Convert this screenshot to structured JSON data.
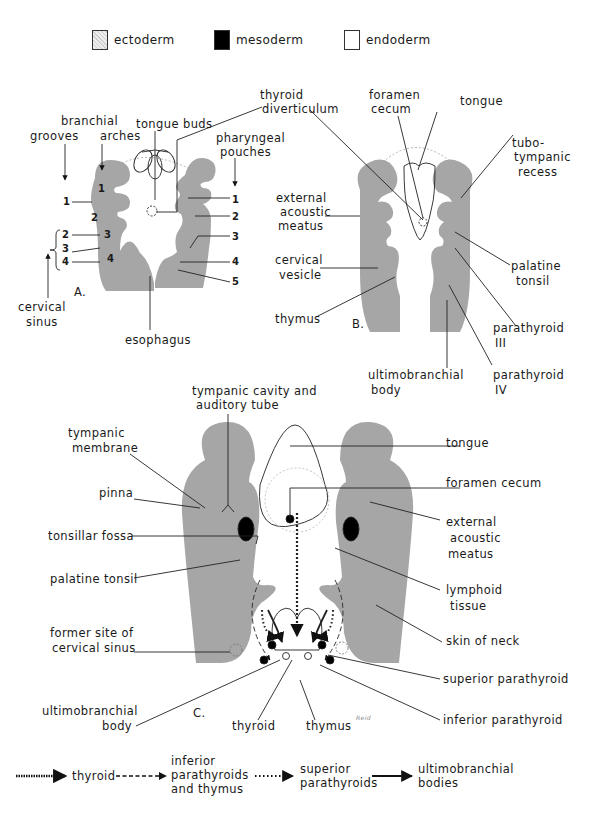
{
  "legend_top": [
    {
      "label": "ectoderm",
      "swatch": "stippled-gray"
    },
    {
      "label": "mesoderm",
      "swatch": "#000000"
    },
    {
      "label": "endoderm",
      "swatch": "#ffffff"
    }
  ],
  "colors": {
    "tissue_gray": "#a6a6a6",
    "line": "#222222",
    "background": "#ffffff"
  },
  "panel_a": {
    "letter": "A.",
    "labels": {
      "tongue_buds": "tongue buds",
      "thyroid_diverticulum": [
        "thyroid",
        "diverticulum"
      ],
      "branchial": "branchial",
      "grooves": "grooves",
      "arches": "arches",
      "pharyngeal_pouches": [
        "pharyngeal",
        "pouches"
      ],
      "cervical_sinus": [
        "cervical",
        "sinus"
      ],
      "esophagus": "esophagus"
    },
    "arch_numbers": [
      "1",
      "2",
      "3",
      "4"
    ],
    "groove_numbers": [
      "1",
      "2",
      "3",
      "4"
    ],
    "pouch_numbers": [
      "1",
      "2",
      "3",
      "4",
      "5"
    ]
  },
  "panel_b": {
    "letter": "B.",
    "labels": {
      "foramen_cecum": [
        "foramen",
        "cecum"
      ],
      "tongue": "tongue",
      "tubo_tympanic_recess": [
        "tubo-",
        "tympanic",
        "recess"
      ],
      "external_acoustic_meatus": [
        "external",
        "acoustic",
        "meatus"
      ],
      "cervical_vesicle": [
        "cervical",
        "vesicle"
      ],
      "thymus": "thymus",
      "palatine_tonsil": [
        "palatine",
        "tonsil"
      ],
      "parathyroid_iii": [
        "parathyroid",
        "III"
      ],
      "parathyroid_iv": [
        "parathyroid",
        "IV"
      ],
      "ultimobranchial_body": [
        "ultimobranchial",
        "body"
      ]
    }
  },
  "panel_c": {
    "letter": "C.",
    "signature": "Reid",
    "labels": {
      "tympanic_cavity": [
        "tympanic cavity and",
        "auditory tube"
      ],
      "tympanic_membrane": [
        "tympanic",
        "membrane"
      ],
      "pinna": "pinna",
      "tonsillar_fossa": "tonsillar fossa",
      "palatine_tonsil": "palatine tonsil",
      "former_site": [
        "former site of",
        "cervical sinus"
      ],
      "ultimobranchial_body": [
        "ultimobranchial",
        "body"
      ],
      "thyroid": "thyroid",
      "thymus": "thymus",
      "tongue": "tongue",
      "foramen_cecum": "foramen cecum",
      "external_acoustic_meatus": [
        "external",
        "acoustic",
        "meatus"
      ],
      "lymphoid_tissue": [
        "lymphoid",
        "tissue"
      ],
      "skin_of_neck": "skin of neck",
      "superior_parathyroid": "superior parathyroid",
      "inferior_parathyroid": "inferior parathyroid"
    }
  },
  "legend_bottom": [
    {
      "line_style": "heavy-dotted",
      "label": [
        "thyroid"
      ]
    },
    {
      "line_style": "dashed",
      "label": [
        "inferior",
        "parathyroids",
        "and thymus"
      ]
    },
    {
      "line_style": "dotted",
      "label": [
        "superior",
        "parathyroids"
      ]
    },
    {
      "line_style": "solid",
      "label": [
        "ultimobranchial",
        "bodies"
      ]
    }
  ]
}
